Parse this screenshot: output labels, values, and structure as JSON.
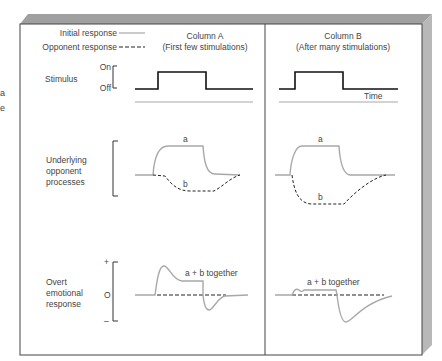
{
  "left_fragments": [
    "a",
    "e"
  ],
  "legend": {
    "initial_label": "Initial response",
    "opponent_label": "Opponent response"
  },
  "columns": [
    {
      "title": "Column A",
      "subtitle": "(First few stimulations)"
    },
    {
      "title": "Column B",
      "subtitle": "(After many stimulations)"
    }
  ],
  "rows": {
    "stimulus": {
      "label": "Stimulus",
      "on_label": "On",
      "off_label": "Off",
      "time_label": "Time"
    },
    "processes": {
      "label_lines": [
        "Underlying",
        "opponent",
        "processes"
      ],
      "a_label": "a",
      "b_label": "b"
    },
    "emotional": {
      "label_lines": [
        "Overt",
        "emotional",
        "response"
      ],
      "plus": "+",
      "zero": "O",
      "minus": "–",
      "sum_label": "a + b together"
    }
  },
  "colors": {
    "frame": "#333333",
    "shadow": "#b3b3b3",
    "shadow_top": "#9a9a9a",
    "initial_line": "#a8a8a8",
    "opponent_line": "#222222",
    "stimulus_line": "#111111",
    "text": "#444444"
  }
}
